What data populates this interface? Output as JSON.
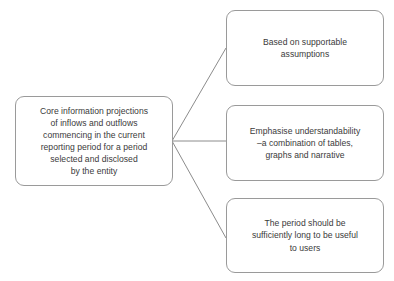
{
  "diagram": {
    "type": "radial-branch-flowchart",
    "background_color": "#ffffff",
    "line_color": "#8c8c8c",
    "border_color": "#9a9a9a",
    "text_color": "#3a3a3a",
    "root": {
      "text": "Core information projections\nof inflows and outflows\ncommencing in the current\nreporting period for a period\nselected and disclosed\nby the entity"
    },
    "branches": [
      {
        "text": "Based on supportable\nassumptions"
      },
      {
        "text": "Emphasise understandability\n–a combination of tables,\ngraphs and narrative"
      },
      {
        "text": "The period should be\nsufficiently long to be useful\nto users"
      }
    ]
  }
}
